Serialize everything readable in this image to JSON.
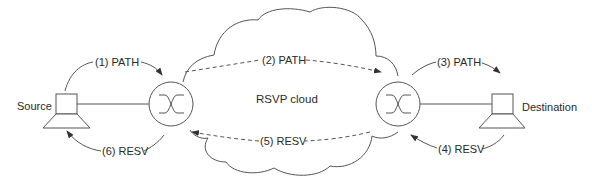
{
  "diagram": {
    "cloud_label": "RSVP cloud",
    "nodes": {
      "source": {
        "label": "Source",
        "type": "host"
      },
      "router_left": {
        "type": "router"
      },
      "router_right": {
        "type": "router"
      },
      "destination": {
        "label": "Destination",
        "type": "host"
      }
    },
    "messages": [
      {
        "step": 1,
        "label": "(1) PATH",
        "from": "Source",
        "to": "router_left",
        "style": "solid"
      },
      {
        "step": 2,
        "label": "(2) PATH",
        "from": "router_left",
        "to": "router_right",
        "style": "dashed"
      },
      {
        "step": 3,
        "label": "(3) PATH",
        "from": "router_right",
        "to": "Destination",
        "style": "solid"
      },
      {
        "step": 4,
        "label": "(4) RESV",
        "from": "Destination",
        "to": "router_right",
        "style": "solid"
      },
      {
        "step": 5,
        "label": "(5) RESV",
        "from": "router_right",
        "to": "router_left",
        "style": "dashed"
      },
      {
        "step": 6,
        "label": "(6) RESV",
        "from": "router_left",
        "to": "Source",
        "style": "solid"
      }
    ],
    "colors": {
      "line": "#555555",
      "text": "#2a2a2a",
      "background": "#ffffff"
    }
  }
}
